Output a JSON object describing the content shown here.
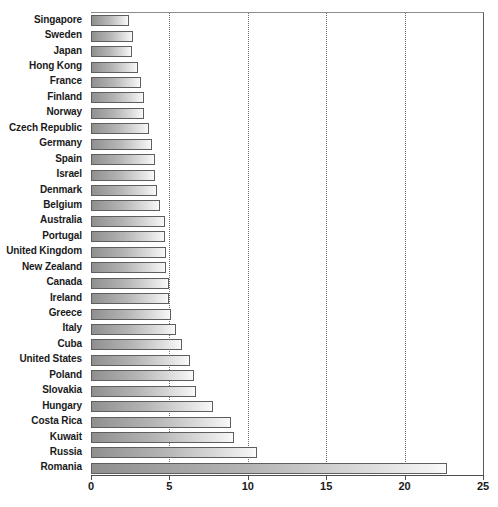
{
  "chart_data": {
    "type": "bar",
    "orientation": "horizontal",
    "title": "",
    "subtitle": "",
    "xlabel": "",
    "ylabel": "",
    "xlim": [
      0,
      25
    ],
    "grid": true,
    "legend": null,
    "xticks": [
      "0",
      "5",
      "10",
      "15",
      "20",
      "25"
    ],
    "xtick_values": [
      0,
      5,
      10,
      15,
      20,
      25
    ],
    "categories": [
      "Singapore",
      "Sweden",
      "Japan",
      "Hong Kong",
      "France",
      "Finland",
      "Norway",
      "Czech Republic",
      "Germany",
      "Spain",
      "Israel",
      "Denmark",
      "Belgium",
      "Australia",
      "Portugal",
      "United Kingdom",
      "New Zealand",
      "Canada",
      "Ireland",
      "Greece",
      "Italy",
      "Cuba",
      "United States",
      "Poland",
      "Slovakia",
      "Hungary",
      "Costa Rica",
      "Kuwait",
      "Russia",
      "Romania"
    ],
    "values": [
      2.4,
      2.7,
      2.6,
      3.0,
      3.2,
      3.4,
      3.4,
      3.7,
      3.9,
      4.1,
      4.1,
      4.2,
      4.4,
      4.7,
      4.7,
      4.8,
      4.8,
      5.0,
      5.0,
      5.1,
      5.4,
      5.8,
      6.3,
      6.6,
      6.7,
      7.8,
      8.9,
      9.1,
      10.6,
      22.7
    ]
  },
  "style": {
    "bar_gradient_dark": "#8f8f8f",
    "bar_gradient_light": "#fbfbfb",
    "bar_border": "#5e5e5e",
    "gridline_color": "#6e6e6e",
    "axis_color": "#4d4d4d",
    "label_color": "#1a1a1a",
    "background": "#ffffff"
  }
}
